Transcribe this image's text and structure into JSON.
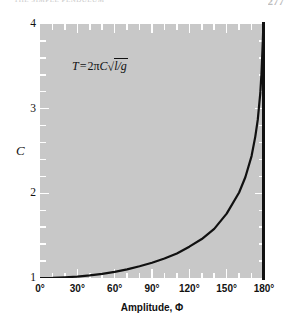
{
  "page": {
    "header_text": "THE SIMPLE PENDULUM",
    "number": "277"
  },
  "chart_data": {
    "type": "line",
    "title": "",
    "subtitle": "",
    "xlabel": "Amplitude, Φ",
    "ylabel": "C",
    "annotation": "T = 2πC√l/g",
    "equation_parts": {
      "lhs": "T",
      "eq": "=",
      "coef": "2π",
      "var": "C",
      "radical": "√",
      "radicand": "l/g"
    },
    "xlim": [
      0,
      180
    ],
    "ylim": [
      1,
      4
    ],
    "xtick_labels": [
      "0°",
      "30°",
      "60°",
      "90°",
      "120°",
      "150°",
      "180°"
    ],
    "xticks": [
      0,
      30,
      60,
      90,
      120,
      150,
      180
    ],
    "xminor_step": 10,
    "ytick_labels": [
      "1",
      "2",
      "3",
      "4"
    ],
    "yticks": [
      1,
      2,
      3,
      4
    ],
    "yminor_step": 0.2,
    "grid": false,
    "legend": "none",
    "panel_color": "#c8c8c8",
    "line_color": "#111111",
    "tick_color": "#ffffff",
    "series": [
      {
        "name": "C",
        "x": [
          0,
          10,
          20,
          30,
          40,
          50,
          60,
          70,
          80,
          90,
          100,
          110,
          120,
          130,
          140,
          150,
          160,
          165,
          170,
          173,
          175,
          177,
          178,
          179,
          179.5,
          179.8,
          180
        ],
        "values": [
          1.0,
          1.002,
          1.008,
          1.017,
          1.031,
          1.049,
          1.073,
          1.102,
          1.139,
          1.18,
          1.23,
          1.29,
          1.37,
          1.46,
          1.58,
          1.76,
          2.01,
          2.19,
          2.44,
          2.67,
          2.87,
          3.18,
          3.42,
          3.78,
          4.0,
          4.0,
          4.0
        ]
      }
    ]
  }
}
